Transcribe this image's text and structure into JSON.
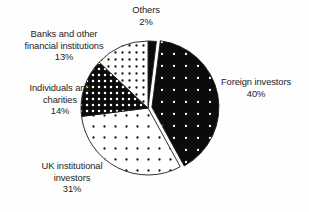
{
  "chart_data": {
    "type": "pie",
    "title": "",
    "subtitle": "",
    "xlabel": "",
    "ylabel": "",
    "legend_position": "none",
    "grid": false,
    "labels_inline": true,
    "start_angle_deg": 0,
    "direction": "clockwise",
    "categories": [
      "Others",
      "Foreign investors",
      "UK institutional investors",
      "Individuals and charities",
      "Banks and other financial institutions"
    ],
    "values": [
      2,
      40,
      31,
      14,
      13
    ],
    "value_suffix": "%",
    "total": 100,
    "slices": [
      {
        "name": "Others",
        "value": 2,
        "percent_label": "2%",
        "name_lines": [
          "Others"
        ],
        "fill_style": "solid-black",
        "exploded": false,
        "start_deg": 0,
        "end_deg": 7.2
      },
      {
        "name": "Foreign investors",
        "value": 40,
        "percent_label": "40%",
        "name_lines": [
          "Foreign investors"
        ],
        "fill_style": "black-with-white-dots",
        "exploded": true,
        "start_deg": 7.2,
        "end_deg": 151.2
      },
      {
        "name": "UK institutional investors",
        "value": 31,
        "percent_label": "31%",
        "name_lines": [
          "UK institutional",
          "investors"
        ],
        "fill_style": "white-with-sparse-black-dots",
        "exploded": false,
        "start_deg": 151.2,
        "end_deg": 262.8
      },
      {
        "name": "Individuals and charities",
        "value": 14,
        "percent_label": "14%",
        "name_lines": [
          "Individuals and",
          "charities"
        ],
        "fill_style": "black-with-dense-white-dots",
        "exploded": false,
        "start_deg": 262.8,
        "end_deg": 313.2
      },
      {
        "name": "Banks and other financial institutions",
        "value": 13,
        "percent_label": "13%",
        "name_lines": [
          "Banks and other",
          "financial institutions"
        ],
        "fill_style": "white-with-dense-black-dots",
        "exploded": false,
        "start_deg": 313.2,
        "end_deg": 360
      }
    ],
    "colors": {
      "background": "#fefefe",
      "outline": "#1a1a1a",
      "ink": "#242424",
      "fill_dark": "#0b0b0b",
      "fill_light": "#ffffff"
    }
  },
  "labels": {
    "others": {
      "line1": "Others",
      "line2": "",
      "pct": "2%"
    },
    "banks": {
      "line1": "Banks and other",
      "line2": "financial institutions",
      "pct": "13%"
    },
    "individuals": {
      "line1": "Individuals and",
      "line2": "charities",
      "pct": "14%"
    },
    "uk": {
      "line1": "UK institutional",
      "line2": "investors",
      "pct": "31%"
    },
    "foreign": {
      "line1": "Foreign investors",
      "line2": "",
      "pct": "40%"
    }
  }
}
